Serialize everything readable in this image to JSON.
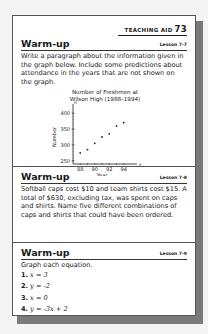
{
  "header": {
    "label": "TEACHING AID",
    "number": "73"
  },
  "sections": [
    {
      "title": "Warm-up",
      "lesson": "Lesson 7-7",
      "text": "Write a paragraph about the information given in the graph below. Include some predictions about attendance in the years that are not shown on the graph."
    },
    {
      "title": "Warm-up",
      "lesson": "Lesson 7-8",
      "text": "Softball caps cost $10 and team shirts cost $15. A total of $630, excluding tax, was spent on caps and shirts. Name five different combinations of caps and shirts that could have been ordered."
    },
    {
      "title": "Warm-up",
      "lesson": "Lesson 7-9",
      "text": "Graph each equation.",
      "equations": [
        {
          "num": "1.",
          "eq": "x = 3"
        },
        {
          "num": "2.",
          "eq": "y = -2"
        },
        {
          "num": "3.",
          "eq": "x = 0"
        },
        {
          "num": "4.",
          "eq": "y = -3x + 2"
        }
      ]
    }
  ],
  "chart_data": {
    "type": "scatter",
    "title_line1": "Number of Freshmen at",
    "title_line2": "Wilson High (1988–1994)",
    "xlabel": "Year",
    "ylabel": "Number",
    "x_axis_letter": "y",
    "y_axis_letter": "n",
    "x": [
      88,
      89,
      90,
      91,
      92,
      93,
      94
    ],
    "values": [
      275,
      285,
      305,
      325,
      335,
      360,
      370
    ],
    "x_ticks": [
      "88",
      "90",
      "92",
      "94"
    ],
    "y_ticks": [
      "250",
      "300",
      "350",
      "400"
    ],
    "xlim": [
      87,
      95
    ],
    "ylim": [
      240,
      410
    ],
    "grid": false
  }
}
